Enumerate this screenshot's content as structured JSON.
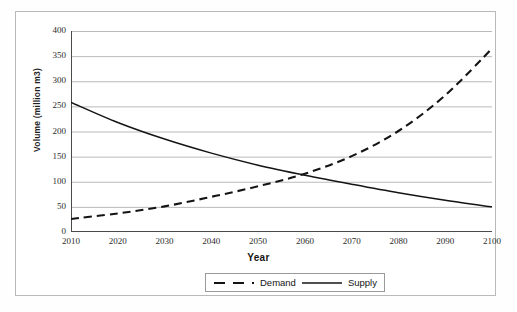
{
  "chart_data": {
    "type": "line",
    "title": "",
    "xlabel": "Year",
    "ylabel": "Volume (million m3)",
    "xlim": [
      2010,
      2100
    ],
    "ylim": [
      0,
      400
    ],
    "grid": true,
    "grid_axis": "y",
    "legend_position": "bottom",
    "x_ticks": [
      "2010",
      "2020",
      "2030",
      "2040",
      "2050",
      "2060",
      "2070",
      "2080",
      "2090",
      "2100"
    ],
    "y_ticks": [
      "0",
      "50",
      "100",
      "150",
      "200",
      "250",
      "300",
      "350",
      "400"
    ],
    "x": [
      2010,
      2020,
      2030,
      2040,
      2050,
      2060,
      2070,
      2080,
      2090,
      2100
    ],
    "series": [
      {
        "name": "Demand",
        "style": "dashed",
        "color": "#141414",
        "values": [
          26,
          37,
          51,
          70,
          91,
          116,
          151,
          201,
          272,
          365
        ]
      },
      {
        "name": "Supply",
        "style": "solid",
        "color": "#141414",
        "values": [
          258,
          218,
          185,
          157,
          133,
          113,
          95,
          78,
          63,
          50
        ]
      }
    ],
    "annotations": {
      "crossover_year": 2057,
      "crossover_value": 103
    }
  },
  "legend": {
    "items": [
      {
        "label": "Demand",
        "style": "dashed"
      },
      {
        "label": "Supply",
        "style": "solid"
      }
    ]
  }
}
